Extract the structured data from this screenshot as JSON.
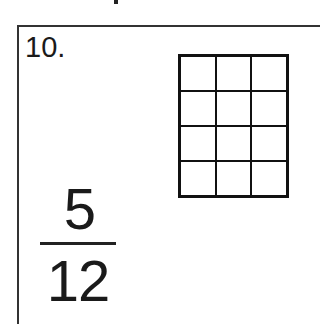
{
  "problem": {
    "number": "10.",
    "grid": {
      "rows": 4,
      "columns": 3,
      "shaded_cells": 0
    },
    "fraction": {
      "numerator": "5",
      "denominator": "12"
    }
  }
}
